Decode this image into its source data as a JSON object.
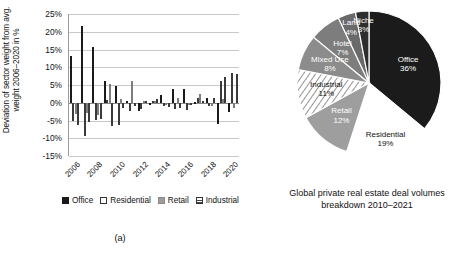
{
  "figure": {
    "subcaption_a": "(a)",
    "subcaption_b": "(b)"
  },
  "panel_a": {
    "ylabel": "Deviation of sector weight from avg. weight 2006–2020 in %",
    "legend": [
      {
        "label": "Office",
        "icon": "square-solid-black-icon"
      },
      {
        "label": "Residential",
        "icon": "square-outline-white-icon"
      },
      {
        "label": "Retail",
        "icon": "square-solid-gray-icon"
      },
      {
        "label": "Industrial",
        "icon": "square-hatched-icon"
      }
    ],
    "chart_data": {
      "type": "bar",
      "title": "",
      "xlabel": "",
      "ylabel": "Deviation of sector weight from avg. weight 2006–2020 in %",
      "ylim": [
        -15,
        25
      ],
      "yticks": [
        "25%",
        "20%",
        "15%",
        "10%",
        "5%",
        "0%",
        "-5%",
        "-10%",
        "-15%"
      ],
      "ytick_values": [
        25,
        20,
        15,
        10,
        5,
        0,
        -5,
        -10,
        -15
      ],
      "grid": true,
      "legend_position": "below",
      "categories": [
        "2006",
        "2007",
        "2008",
        "2009",
        "2010",
        "2011",
        "2012",
        "2013",
        "2014",
        "2015",
        "2016",
        "2017",
        "2018",
        "2019",
        "2020"
      ],
      "xtick_labels": [
        "2006",
        "2008",
        "2010",
        "2012",
        "2014",
        "2016",
        "2018",
        "2020"
      ],
      "series": [
        {
          "name": "Office",
          "values": [
            13.3,
            21.5,
            15.6,
            6.0,
            4.8,
            0.5,
            -2.2,
            -0.4,
            2.2,
            4.0,
            3.9,
            0.3,
            1.2,
            -6.0,
            -2.5
          ]
        },
        {
          "name": "Residential",
          "values": [
            -5.0,
            -9.5,
            -4.8,
            0.9,
            -6.2,
            -2.4,
            -1.8,
            0.5,
            -1.0,
            -1.9,
            -2.0,
            1.2,
            -1.0,
            6.2,
            8.5
          ]
        },
        {
          "name": "Retail",
          "values": [
            -3.3,
            -2.9,
            -3.4,
            5.3,
            1.0,
            6.0,
            0.4,
            0.6,
            -0.3,
            1.4,
            -0.2,
            2.4,
            -1.0,
            1.0,
            -1.4
          ]
        },
        {
          "name": "Industrial",
          "values": [
            -6.4,
            -5.3,
            -4.6,
            -6.5,
            -1.5,
            -0.8,
            0.6,
            1.1,
            -1.3,
            -1.6,
            -0.6,
            0.6,
            1.3,
            7.2,
            8.0
          ]
        }
      ]
    }
  },
  "panel_b": {
    "caption": "Global private real estate deal volumes breakdown 2010–2021",
    "caption_lines": [
      "Global private real estate deal",
      "volumes breakdown",
      "2010–2021"
    ],
    "chart_data": {
      "type": "pie",
      "title": "Global private real estate deal volumes breakdown 2010–2021",
      "labels": [
        "Office",
        "Residential",
        "Retail",
        "Industrial",
        "Mixed Use",
        "Hotel",
        "Land",
        "Niche"
      ],
      "values": [
        36,
        19,
        12,
        11,
        8,
        7,
        4,
        3
      ],
      "value_labels": [
        "36%",
        "19%",
        "12%",
        "11%",
        "8%",
        "7%",
        "4%",
        "3%"
      ],
      "colors": [
        "#1b1b1b",
        "#ffffff",
        "#9e9e9e",
        "#ffffff",
        "#8c8c8c",
        "#7d7d7d",
        "#6a6a6a",
        "#2e2e2e"
      ],
      "legend_position": "none"
    }
  }
}
